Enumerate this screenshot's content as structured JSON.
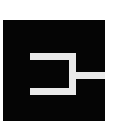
{
  "image": {
    "kind": "icon-logo",
    "width": 124,
    "height": 132,
    "background_color": "#ffffff",
    "alt_text": ""
  },
  "logo": {
    "name": "connector-bracket-logo",
    "plate": {
      "shape": "square",
      "color": "#050505",
      "x": 3,
      "y": 20,
      "width": 102,
      "height": 101
    },
    "glyph": {
      "name": "bracket-stem-glyph",
      "color": "#eaeaea",
      "description": "open-left rectangular bracket with horizontal stem extending to the right edge",
      "stroke": 7,
      "segments": [
        {
          "name": "top-bar",
          "x": 27,
          "y": 33,
          "width": 46,
          "height": 7
        },
        {
          "name": "bottom-bar",
          "x": 27,
          "y": 68,
          "width": 46,
          "height": 7
        },
        {
          "name": "right-upright",
          "x": 66,
          "y": 33,
          "width": 7,
          "height": 42
        },
        {
          "name": "right-stem",
          "x": 66,
          "y": 52,
          "width": 36,
          "height": 7
        }
      ]
    }
  }
}
